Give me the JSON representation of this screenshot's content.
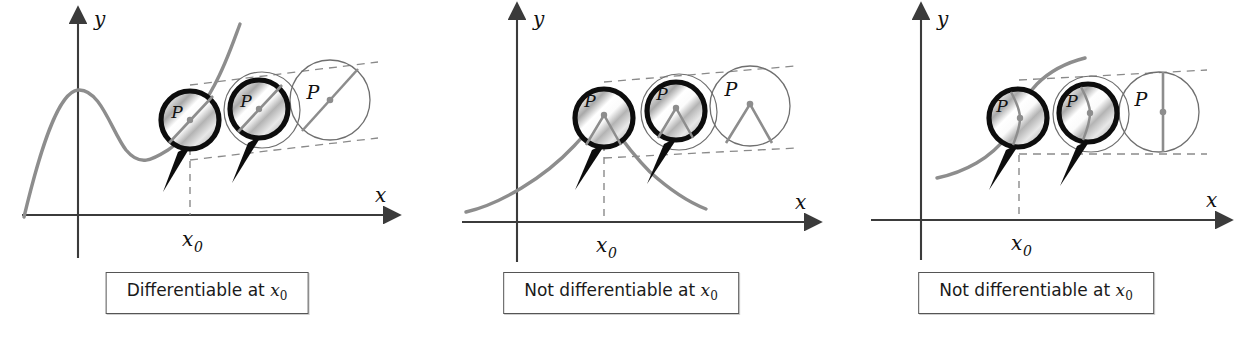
{
  "figure": {
    "panel_count": 3,
    "background_color": "#ffffff"
  },
  "colors": {
    "axis": "#3b3b3b",
    "curve": "#8d8d8d",
    "magnifier_ring": "#0d0d0d",
    "magnifier_handle": "#0d0d0d",
    "thin_circle": "#6f6f6f",
    "dashed_guide": "#8a8a8a",
    "dashed_drop": "#8a8a8a",
    "label_text": "#111111",
    "caption_border": "#555555",
    "lens_light": "#ffffff",
    "lens_mid": "#d6d6d6",
    "lens_dark": "#9a9a9a"
  },
  "axis_labels": {
    "y": "y",
    "x": "x",
    "x0_var": "x",
    "x0_sub": "0"
  },
  "point_label": "P",
  "panels": [
    {
      "id": "panel-differentiable",
      "index": 0,
      "caption": {
        "prefix": "Differentiable at ",
        "var": "x",
        "sub": "0",
        "full": "Differentiable at x0"
      },
      "curve_description": "smooth wave with a peak left of the y-axis, dipping to a trough then rising through P",
      "magnified_view": "straight line through P — curve looks like its tangent line",
      "zoom_stages": [
        {
          "stage": 1,
          "style": "magnifier",
          "label": "P",
          "inner": "straight-line"
        },
        {
          "stage": 2,
          "style": "magnifier",
          "label": "P",
          "inner": "straight-line"
        },
        {
          "stage": 3,
          "style": "plain-circle",
          "label": "P",
          "inner": "straight-line"
        }
      ]
    },
    {
      "id": "panel-corner",
      "index": 1,
      "caption": {
        "prefix": "Not differentiable at ",
        "var": "x",
        "sub": "0",
        "full": "Not differentiable at x0"
      },
      "curve_description": "curve rising to a sharp corner at x0 then falling",
      "magnified_view": "sharp corner persists — no single tangent line",
      "zoom_stages": [
        {
          "stage": 1,
          "style": "magnifier",
          "label": "P",
          "inner": "corner"
        },
        {
          "stage": 2,
          "style": "magnifier",
          "label": "P",
          "inner": "corner"
        },
        {
          "stage": 3,
          "style": "plain-circle",
          "label": "P",
          "inner": "corner"
        }
      ]
    },
    {
      "id": "panel-vertical-tangent",
      "index": 2,
      "caption": {
        "prefix": "Not differentiable at ",
        "var": "x",
        "sub": "0",
        "full": "Not differentiable at x0"
      },
      "curve_description": "steep S-shaped curve with a vertical tangent at x0",
      "magnified_view": "vertical line through P — tangent is vertical, slope undefined",
      "zoom_stages": [
        {
          "stage": 1,
          "style": "magnifier",
          "label": "P",
          "inner": "vertical-line"
        },
        {
          "stage": 2,
          "style": "magnifier",
          "label": "P",
          "inner": "vertical-line"
        },
        {
          "stage": 3,
          "style": "plain-circle",
          "label": "P",
          "inner": "vertical-line"
        }
      ]
    }
  ]
}
